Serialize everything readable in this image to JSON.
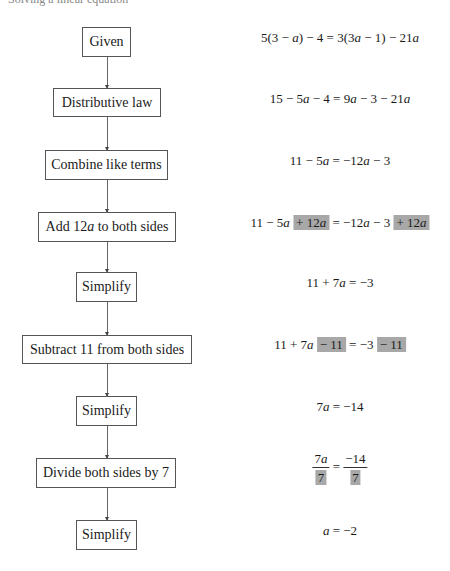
{
  "header_partial": "Solving a linear equation",
  "steps": [
    {
      "label": "Given",
      "equation": [
        "5(3 − ",
        {
          "v": "a"
        },
        ") − 4 = 3(3",
        {
          "v": "a"
        },
        " − 1) − 21",
        {
          "v": "a"
        }
      ]
    },
    {
      "label": "Distributive law",
      "equation": [
        "15 − 5",
        {
          "v": "a"
        },
        " − 4 = 9",
        {
          "v": "a"
        },
        " − 3 − 21",
        {
          "v": "a"
        }
      ]
    },
    {
      "label": "Combine like terms",
      "equation": [
        "11 − 5",
        {
          "v": "a"
        },
        " = −12",
        {
          "v": "a"
        },
        " − 3"
      ]
    },
    {
      "label": "Add 12a to both sides",
      "equation": [
        "11 − 5",
        {
          "v": "a"
        },
        " ",
        {
          "hl": "+ 12a"
        },
        " = −12",
        {
          "v": "a"
        },
        " − 3 ",
        {
          "hl": "+ 12a"
        }
      ]
    },
    {
      "label": "Simplify",
      "equation": [
        "11 + 7",
        {
          "v": "a"
        },
        " = −3"
      ]
    },
    {
      "label": "Subtract 11 from both sides",
      "equation": [
        "11 + 7",
        {
          "v": "a"
        },
        " ",
        {
          "hl": "− 11"
        },
        " = −3 ",
        {
          "hl": "− 11"
        }
      ]
    },
    {
      "label": "Simplify",
      "equation": [
        "7",
        {
          "v": "a"
        },
        " = −14"
      ]
    },
    {
      "label": "Divide both sides by 7",
      "equation": [
        {
          "frac": [
            "7a",
            "7"
          ]
        },
        " = ",
        {
          "frac": [
            "−14",
            "7"
          ]
        }
      ]
    },
    {
      "label": "Simplify",
      "equation": [
        {
          "v": "a"
        },
        " = −2"
      ]
    }
  ],
  "colors": {
    "highlight": "#a8a8a8",
    "border": "#555555"
  }
}
